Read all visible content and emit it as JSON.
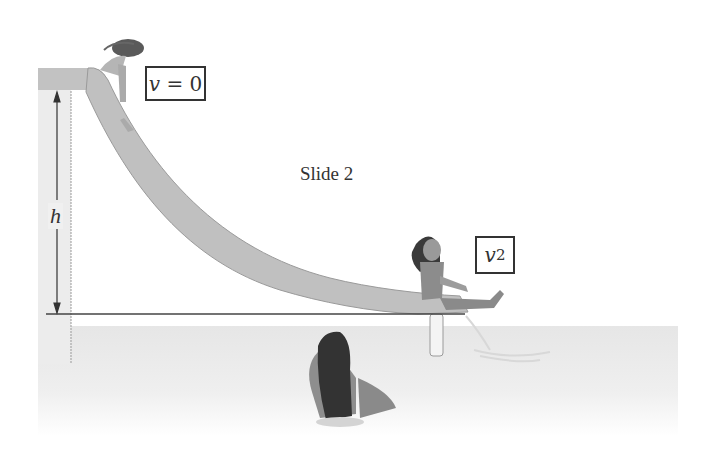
{
  "diagram": {
    "title": "Slide 2",
    "height_label": "h",
    "start_label": {
      "var": "v",
      "eq": " = 0"
    },
    "end_label": {
      "var": "v",
      "sub": "2"
    },
    "colors": {
      "slide": "#bdbdbd",
      "slide_edge": "#9a9a9a",
      "tower": "#ececec",
      "water": "#e8e8e8",
      "line": "#444444",
      "hair": "#3a3a3a",
      "skin": "#a8a8a8"
    }
  }
}
